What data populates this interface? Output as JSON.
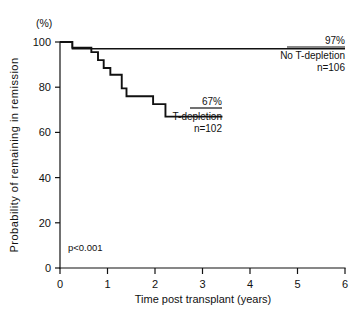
{
  "chart_data": {
    "type": "line",
    "title": "",
    "subtitle": "",
    "xlabel": "Time post transplant (years)",
    "ylabel": "Probability of remaining in remission",
    "yunit": "(%)",
    "xlim": [
      0,
      6
    ],
    "ylim": [
      0,
      100
    ],
    "xticks": [
      0,
      1,
      2,
      3,
      4,
      5,
      6
    ],
    "xticklabels": [
      "0",
      "1",
      "2",
      "3",
      "4",
      "5",
      "6"
    ],
    "yticks": [
      0,
      20,
      40,
      60,
      80,
      100
    ],
    "yticklabels": [
      "0",
      "20",
      "40",
      "60",
      "80",
      "100"
    ],
    "grid": false,
    "legend_position": "inline-annotations",
    "style": "kaplan-meier-step",
    "series": [
      {
        "name": "No T-depletion",
        "n": 106,
        "end_label": "97%",
        "label_line1": "No T-depletion",
        "label_line2": "n=106",
        "color": "#111111",
        "points": [
          [
            0.0,
            100
          ],
          [
            0.26,
            100
          ],
          [
            0.26,
            97
          ],
          [
            6.0,
            97
          ]
        ]
      },
      {
        "name": "T-depletion",
        "n": 102,
        "end_label": "67%",
        "label_line1": "T-depletion",
        "label_line2": "n=102",
        "color": "#111111",
        "points": [
          [
            0.0,
            100
          ],
          [
            0.26,
            100
          ],
          [
            0.26,
            97.5
          ],
          [
            0.66,
            97.5
          ],
          [
            0.66,
            95.5
          ],
          [
            0.8,
            95.5
          ],
          [
            0.8,
            92.0
          ],
          [
            0.92,
            92.0
          ],
          [
            0.92,
            88.5
          ],
          [
            1.06,
            88.5
          ],
          [
            1.06,
            85.5
          ],
          [
            1.3,
            85.5
          ],
          [
            1.3,
            79.5
          ],
          [
            1.4,
            79.5
          ],
          [
            1.4,
            76.0
          ],
          [
            1.96,
            76.0
          ],
          [
            1.96,
            72.5
          ],
          [
            2.22,
            72.5
          ],
          [
            2.22,
            67.0
          ],
          [
            3.42,
            67.0
          ]
        ]
      }
    ],
    "annotations": [
      {
        "text": "p<0.001",
        "x": 0.18,
        "y": 7.5
      },
      {
        "text": "97%",
        "x": 5.75,
        "y": 101.5
      },
      {
        "text": "67%",
        "x": 3.05,
        "y": 73.5
      }
    ]
  }
}
